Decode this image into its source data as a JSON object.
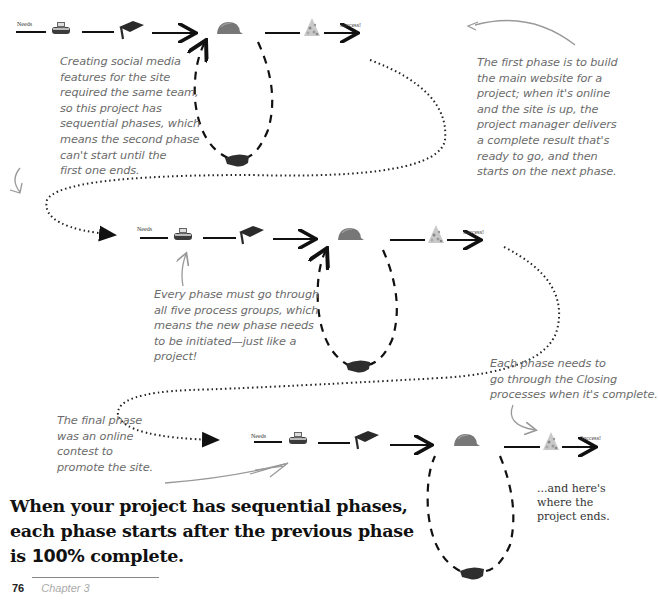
{
  "diagram": {
    "phases": [
      {
        "id": "phase-1",
        "start_label": "Needs",
        "end_label": "Success!",
        "process_groups": [
          "initiating",
          "planning",
          "executing",
          "monitoring-controlling",
          "closing"
        ]
      },
      {
        "id": "phase-2",
        "start_label": "Needs",
        "end_label": "Success!",
        "process_groups": [
          "initiating",
          "planning",
          "executing",
          "monitoring-controlling",
          "closing"
        ]
      },
      {
        "id": "phase-3",
        "start_label": "Needs",
        "end_label": "Success!",
        "process_groups": [
          "initiating",
          "planning",
          "executing",
          "monitoring-controlling",
          "closing"
        ]
      }
    ]
  },
  "annotations": {
    "social_media": [
      "Creating social media",
      "features for the site",
      "required the same team,",
      "so this project has",
      "sequential phases, which",
      "means the second phase",
      "can't start until the",
      "first one ends."
    ],
    "first_phase": [
      "The first phase is to build",
      "the main website for a",
      "project; when it's online",
      "and the site is up, the",
      "project manager delivers",
      "a complete result that's",
      "ready to go, and then",
      "starts on the next phase."
    ],
    "every_phase": [
      "Every phase must go through",
      "all five process groups, which",
      "means the new phase needs",
      "to be initiated—just like a",
      "project!"
    ],
    "closing": [
      "Each phase needs to",
      "go through the Closing",
      "processes when it's complete."
    ],
    "final_phase": [
      "The final phase",
      "was an online",
      "contest to",
      "promote the site."
    ],
    "project_ends": [
      "...and here's",
      "where the",
      "project ends."
    ]
  },
  "headline": {
    "line1": "When your project has sequential phases,",
    "line2": "each phase starts after the previous phase",
    "line3_prefix": "is ",
    "line3_pct": "100%",
    "line3_suffix": " complete."
  },
  "footer": {
    "page_number": "76",
    "chapter": "Chapter 3"
  }
}
